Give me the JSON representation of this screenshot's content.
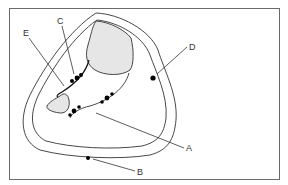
{
  "diagram": {
    "labels": {
      "A": "A",
      "B": "B",
      "C": "C",
      "D": "D",
      "E": "E"
    },
    "colors": {
      "stroke": "#333333",
      "fill_shaded": "#e6e6e6",
      "dot": "#000000",
      "frame": "#6a6a6a"
    }
  }
}
